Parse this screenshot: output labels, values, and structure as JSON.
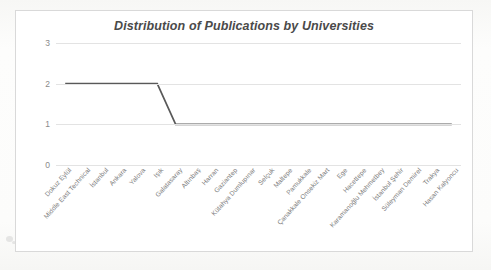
{
  "chart_data": {
    "type": "line",
    "title": "Distribution of Publications by Universities",
    "xlabel": "",
    "ylabel": "",
    "ylim": [
      0,
      3
    ],
    "yticks": [
      0,
      1,
      2,
      3
    ],
    "grid": true,
    "legend": "none",
    "categories": [
      "Dokuz Eylül",
      "Middle East Technical",
      "İstanbul",
      "Ankara",
      "Yalova",
      "Işık",
      "Galatasaray",
      "Altınbaş",
      "Harran",
      "Gaziantep",
      "Kütahya Dumlupınar",
      "Selçuk",
      "Maltepe",
      "Pamukkale",
      "Çanakkale Onsekiz Mart",
      "Ege",
      "Hacettepe",
      "Karamanoğlu Mehmetbey",
      "İstanbul Şehir",
      "Süleyman Demirel",
      "Trakya",
      "Hasan Kalyoncu"
    ],
    "values": [
      2,
      2,
      2,
      2,
      2,
      2,
      1,
      1,
      1,
      1,
      1,
      1,
      1,
      1,
      1,
      1,
      1,
      1,
      1,
      1,
      1,
      1
    ],
    "series_color": "#595959",
    "gridline_color": "#e3e3e3",
    "tick_text_color": "#8a8a8a",
    "title_color": "#4a4a4a",
    "plot_background": "#ffffff",
    "border_color": "#d9d9d9"
  }
}
